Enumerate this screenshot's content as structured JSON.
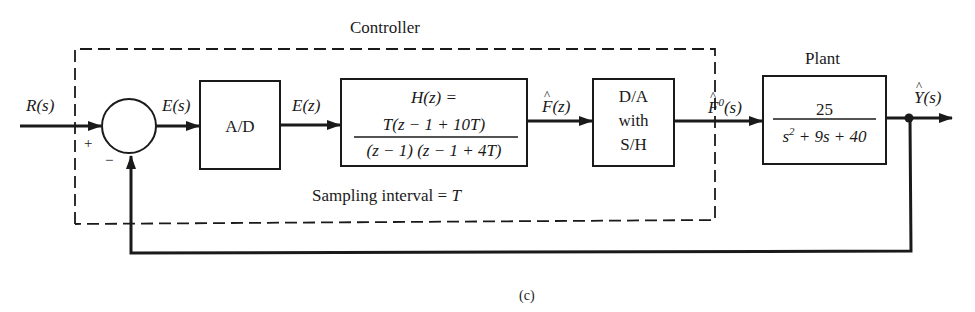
{
  "figure": {
    "caption": "(c)",
    "controller_label": "Controller",
    "plant_label": "Plant",
    "sampling_note": {
      "text": "Sampling interval = ",
      "var": "T"
    }
  },
  "signals": {
    "input": "R(s)",
    "error_s": "E(s)",
    "error_z": "E(z)",
    "controller_out": {
      "letter": "F",
      "arg": "(z)",
      "hat": true
    },
    "dac_out": {
      "letter": "F",
      "sup": "0",
      "arg": "(s)",
      "hat": true
    },
    "output": {
      "letter": "Y",
      "arg": "(s)",
      "hat": true
    }
  },
  "summing_junction": {
    "plus_sign": "+",
    "minus_sign": "−"
  },
  "blocks": {
    "adc": {
      "label": "A/D"
    },
    "controller": {
      "title": "H(z) =",
      "numerator": "T(z − 1 + 10T)",
      "denominator": "(z − 1) (z − 1 + 4T)"
    },
    "dac": {
      "line1": "D/A",
      "line2": "with",
      "line3": "S/H"
    },
    "plant": {
      "numerator": "25",
      "denominator_s2": "s",
      "denominator_exp": "2",
      "denominator_rest": " + 9s + 40"
    }
  },
  "colors": {
    "ink": "#1a1a1a",
    "background": "#ffffff"
  }
}
